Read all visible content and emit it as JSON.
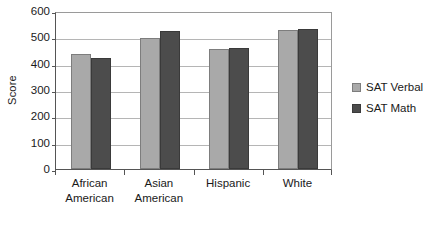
{
  "chart_data": {
    "type": "bar",
    "title": "",
    "subtitle": "",
    "xlabel": "",
    "ylabel": "Score",
    "ylim": [
      0,
      600
    ],
    "ytick_step": 100,
    "yticks": [
      600,
      500,
      400,
      300,
      200,
      100,
      0
    ],
    "grid": true,
    "grid_axis": "y",
    "legend_position": "right",
    "categories": [
      "African American",
      "Asian American",
      "Hispanic",
      "White"
    ],
    "category_lines": [
      [
        "African",
        "American"
      ],
      [
        "Asian",
        "American"
      ],
      [
        "Hispanic",
        ""
      ],
      [
        "White",
        ""
      ]
    ],
    "series": [
      {
        "name": "SAT Verbal",
        "color": "#a9a9a9",
        "values": [
          435,
          498,
          457,
          527
        ]
      },
      {
        "name": "SAT Math",
        "color": "#4c4c4c",
        "values": [
          423,
          525,
          460,
          531
        ]
      }
    ]
  },
  "colors": {
    "verbal": "#a9a9a9",
    "math": "#4c4c4c",
    "gridline": "#b5b5b5",
    "axis": "#555555",
    "text": "#1a1a1a",
    "background": "#ffffff"
  }
}
